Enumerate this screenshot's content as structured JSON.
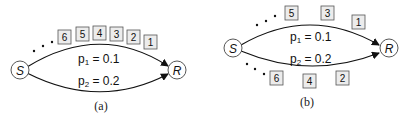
{
  "panels": [
    {
      "id": "a",
      "caption": "(a)",
      "source_node": "S",
      "dest_node": "R",
      "paths": [
        {
          "label_p": "p",
          "label_sub": "1",
          "label_val": " = 0.1"
        },
        {
          "label_p": "p",
          "label_sub": "2",
          "label_val": " = 0.2"
        }
      ],
      "packets_top": [
        "6",
        "5",
        "4",
        "3",
        "2",
        "1"
      ],
      "packets_bottom": []
    },
    {
      "id": "b",
      "caption": "(b)",
      "source_node": "S",
      "dest_node": "R",
      "paths": [
        {
          "label_p": "p",
          "label_sub": "1",
          "label_val": " = 0.1"
        },
        {
          "label_p": "p",
          "label_sub": "2",
          "label_val": " = 0.2"
        }
      ],
      "packets_top": [
        "5",
        "3",
        "1"
      ],
      "packets_bottom": [
        "6",
        "4",
        "2"
      ]
    }
  ]
}
